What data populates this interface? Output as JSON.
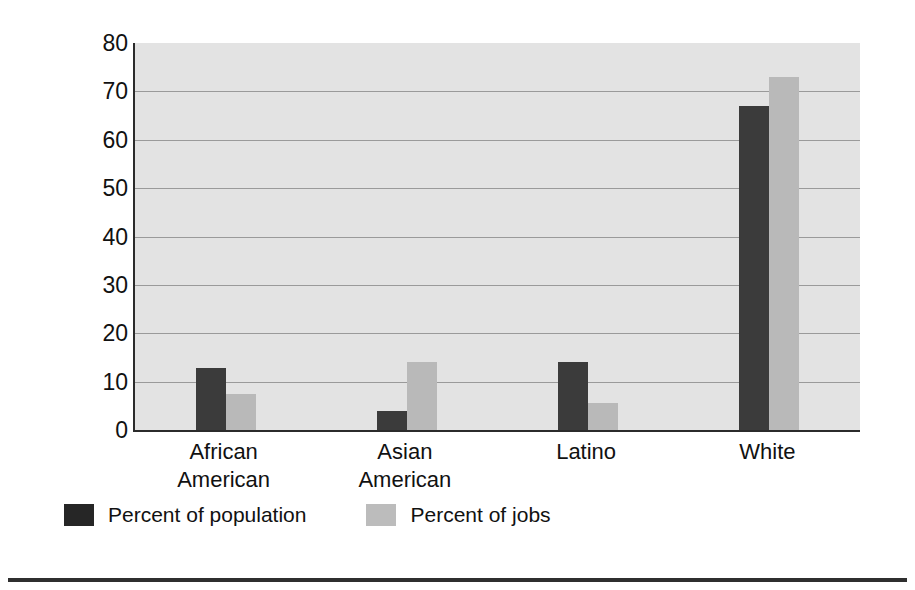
{
  "chart_data": {
    "type": "bar",
    "title": "",
    "subtitle": "",
    "xlabel": "",
    "ylabel": "Percentage",
    "ylim": [
      0,
      80
    ],
    "ytick_step": 10,
    "yticks": [
      80,
      70,
      60,
      50,
      40,
      30,
      20,
      10,
      0
    ],
    "grid": true,
    "grid_axis": "y",
    "legend_position": "bottom-left",
    "categories": [
      "African American",
      "Asian American",
      "Latino",
      "White"
    ],
    "category_lines": [
      [
        "African",
        "American"
      ],
      [
        "Asian",
        "American"
      ],
      [
        "Latino",
        ""
      ],
      [
        "White",
        ""
      ]
    ],
    "series": [
      {
        "name": "Percent of population",
        "color": "#3b3b3b",
        "values": [
          12.8,
          4.0,
          14.0,
          67.0
        ]
      },
      {
        "name": "Percent of jobs",
        "color": "#b9b9b9",
        "values": [
          7.5,
          14.0,
          5.5,
          73.0
        ]
      }
    ]
  },
  "legend": {
    "items": [
      {
        "label": "Percent of population",
        "swatch": "legend-swatch-population"
      },
      {
        "label": "Percent of jobs",
        "swatch": "legend-swatch-jobs"
      }
    ]
  },
  "colors": {
    "plot_background": "#e3e3e3",
    "axis": "#2b2b2b",
    "gridline": "#9a9a9a",
    "series_population": "#3b3b3b",
    "series_jobs": "#b9b9b9",
    "text": "#111111",
    "rule": "#2f2f2f"
  }
}
